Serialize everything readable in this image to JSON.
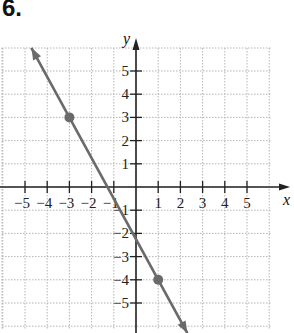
{
  "problem": {
    "number": "6."
  },
  "chart_data": {
    "type": "line",
    "title": "",
    "xlabel": "x",
    "ylabel": "y",
    "xlim": [
      -6,
      6
    ],
    "ylim": [
      -6,
      6
    ],
    "grid": true,
    "x_ticks": [
      -5,
      -4,
      -3,
      -2,
      -1,
      1,
      2,
      3,
      4,
      5
    ],
    "y_ticks": [
      5,
      4,
      3,
      2,
      1,
      -1,
      -2,
      -3,
      -4,
      -5
    ],
    "x_tick_labels": [
      "−5",
      "−4",
      "−3",
      "−2",
      "−1",
      "1",
      "2",
      "3",
      "4",
      "5"
    ],
    "y_tick_labels": [
      "5",
      "4",
      "3",
      "2",
      "1",
      "−1",
      "−2",
      "−3",
      "−4",
      "−5"
    ],
    "series": [
      {
        "name": "line",
        "points": [
          [
            -3,
            3
          ],
          [
            1,
            -4
          ]
        ],
        "slope": -1.75,
        "y_intercept": -2.25,
        "arrows_both_ends": true,
        "color": "#666666"
      }
    ],
    "marked_points": [
      [
        -3,
        3
      ],
      [
        1,
        -4
      ]
    ]
  },
  "colors": {
    "axis": "#222222",
    "grid": "#b5b5b5",
    "line": "#6a6a6a",
    "point": "#6a6a6a"
  }
}
